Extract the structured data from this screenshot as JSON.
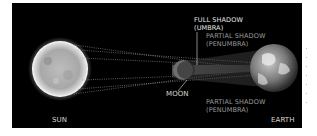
{
  "diagram": {
    "background": "#000000",
    "labels": {
      "sun": "SUN",
      "moon": "MOON",
      "earth": "EARTH",
      "umbra_line1": "FULL SHADOW",
      "umbra_line2": "(UMBRA)",
      "penumbra_top_line1": "PARTIAL SHADOW",
      "penumbra_top_line2": "(PENUMBRA)",
      "penumbra_bottom_line1": "PARTIAL SHADOW",
      "penumbra_bottom_line2": "(PENUMBRA)"
    },
    "bodies": [
      {
        "name": "Sun",
        "color": "#d9d9d9"
      },
      {
        "name": "Moon",
        "color": "#6e6e6e"
      },
      {
        "name": "Earth",
        "color": "#8a8a8a"
      }
    ]
  }
}
